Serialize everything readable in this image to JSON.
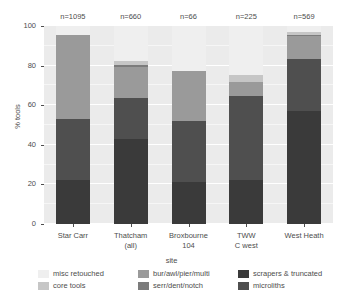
{
  "chart_data": {
    "type": "bar",
    "subtype": "stacked-percent",
    "title": "",
    "xlabel": "site",
    "ylabel": "% tools",
    "ylim": [
      0,
      100
    ],
    "yticks": [
      0,
      20,
      40,
      60,
      80,
      100
    ],
    "grid": true,
    "legend_position": "bottom",
    "categories": [
      "Star Carr",
      "Thatcham (all)",
      "Broxbourne 104",
      "TWW C west",
      "West Heath"
    ],
    "category_lines": [
      [
        "Star Carr",
        ""
      ],
      [
        "Thatcham",
        "(all)"
      ],
      [
        "Broxbourne",
        "104"
      ],
      [
        "TWW",
        "C west"
      ],
      [
        "West Heath",
        ""
      ]
    ],
    "annotations": [
      "n=1095",
      "n=660",
      "n=66",
      "n=225",
      "n=569"
    ],
    "series": [
      {
        "name": "microliths",
        "color": "#3a3a3a",
        "values": [
          22.0,
          43.0,
          21.0,
          22.0,
          57.0
        ]
      },
      {
        "name": "scrapers & truncated",
        "color": "#4f4f4f",
        "values": [
          31.0,
          20.5,
          31.0,
          42.5,
          26.5
        ]
      },
      {
        "name": "bur/awl/pier/multi",
        "color": "#9a9a9a",
        "values": [
          42.5,
          16.0,
          25.5,
          7.0,
          11.5
        ]
      },
      {
        "name": "serr/dent/notch",
        "color": "#7c7c7c",
        "values": [
          0.0,
          1.0,
          0.0,
          0.0,
          0.5
        ]
      },
      {
        "name": "core tools",
        "color": "#c6c6c6",
        "values": [
          0.0,
          2.0,
          0.0,
          4.0,
          1.5
        ]
      },
      {
        "name": "misc retouched",
        "color": "#efefef",
        "values": [
          4.5,
          17.5,
          22.5,
          24.5,
          3.0
        ]
      }
    ]
  },
  "axes": {
    "y_title": "% tools",
    "x_title": "site",
    "y_tick_labels": [
      "100",
      "80",
      "60",
      "40",
      "20",
      "0"
    ]
  },
  "legend": {
    "entries": [
      {
        "label": "misc retouched",
        "color": "#efefef"
      },
      {
        "label": "core tools",
        "color": "#c6c6c6"
      },
      {
        "label": "bur/awl/pier/multi",
        "color": "#9a9a9a"
      },
      {
        "label": "serr/dent/notch",
        "color": "#7c7c7c"
      },
      {
        "label": "scrapers & truncated",
        "color": "#3a3a3a"
      },
      {
        "label": "microliths",
        "color": "#4f4f4f"
      }
    ]
  },
  "colors": {
    "panel_background": "#ebebeb",
    "gridline": "#ffffff",
    "text": "#4d4d4d",
    "page_background": "#ffffff"
  }
}
